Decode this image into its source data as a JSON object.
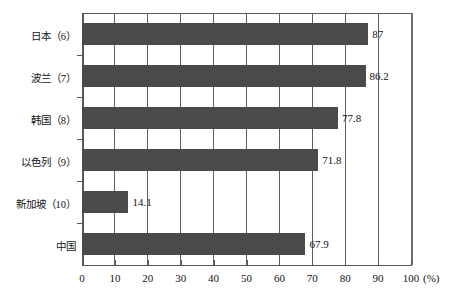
{
  "chart_data": {
    "type": "bar",
    "orientation": "horizontal",
    "title": "",
    "xlabel": "(%)",
    "ylabel": "",
    "xlim": [
      0,
      100
    ],
    "xticks": [
      0,
      10,
      20,
      30,
      40,
      50,
      60,
      70,
      80,
      90,
      100
    ],
    "xtick_labels": [
      "0",
      "10",
      "20",
      "30",
      "40",
      "50",
      "60",
      "70",
      "80",
      "90",
      "100"
    ],
    "grid": true,
    "legend": null,
    "categories": [
      "日本（6）",
      "波兰（7）",
      "韩国（8）",
      "以色列（9）",
      "新加坡（10）",
      "中国"
    ],
    "values": [
      87,
      86.2,
      77.8,
      71.8,
      14.1,
      67.9
    ],
    "value_labels": [
      "87",
      "86.2",
      "77.8",
      "71.8",
      "14.1",
      "67.9"
    ],
    "bar_color": "#4a4a4c",
    "axis_color": "#55595d",
    "background": "#ffffff"
  },
  "axis": {
    "unit": "(%)"
  }
}
